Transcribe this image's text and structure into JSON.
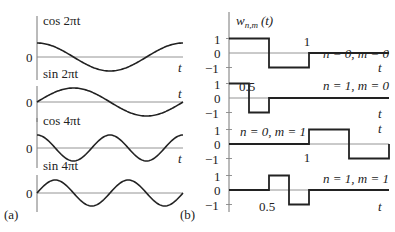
{
  "panel_a": {
    "label": "(a)",
    "zero_label": "0",
    "t_label": "t",
    "plots": [
      {
        "title": "cos 2πt",
        "func": "cos",
        "freq": 1,
        "baseline": 57,
        "amp": 14
      },
      {
        "title": "sin 2πt",
        "func": "sin",
        "freq": 1,
        "baseline": 102,
        "amp": 14
      },
      {
        "title": "cos 4πt",
        "func": "cos",
        "freq": 2,
        "baseline": 148,
        "amp": 13
      },
      {
        "title": "sin 4πt",
        "func": "sin",
        "freq": 2,
        "baseline": 193,
        "amp": 13
      }
    ]
  },
  "panel_b": {
    "label": "(b)",
    "title": "w_{n,m}(t)",
    "title_main": "w",
    "title_sub": "n,m",
    "title_arg": "(t)",
    "t_label": "t",
    "tick_labels": [
      "1",
      "0",
      "−1"
    ],
    "plots": [
      {
        "caption": "n = 0, m = 0",
        "annotation": "1",
        "zero_y": 53,
        "points": [
          [
            0,
            1
          ],
          [
            0.5,
            1
          ],
          [
            0.5,
            -1
          ],
          [
            1,
            -1
          ],
          [
            1,
            0
          ],
          [
            2,
            0
          ]
        ]
      },
      {
        "caption": "n = 1, m = 0",
        "annotation": "0.5",
        "zero_y": 98,
        "points": [
          [
            0,
            1
          ],
          [
            0.25,
            1
          ],
          [
            0.25,
            -1
          ],
          [
            0.5,
            -1
          ],
          [
            0.5,
            0
          ],
          [
            2,
            0
          ]
        ]
      },
      {
        "caption": "n = 0, m = 1",
        "annotation": "1",
        "zero_y": 144,
        "points": [
          [
            0,
            0
          ],
          [
            1,
            0
          ],
          [
            1,
            1
          ],
          [
            1.5,
            1
          ],
          [
            1.5,
            -1
          ],
          [
            2,
            -1
          ],
          [
            2,
            0
          ]
        ]
      },
      {
        "caption": "n = 1, m = 1",
        "annotation": "0.5",
        "zero_y": 190,
        "points": [
          [
            0,
            0
          ],
          [
            0.5,
            0
          ],
          [
            0.5,
            1
          ],
          [
            0.75,
            1
          ],
          [
            0.75,
            -1
          ],
          [
            1,
            -1
          ],
          [
            1,
            0
          ],
          [
            2,
            0
          ]
        ]
      }
    ]
  },
  "chart_data": [
    {
      "type": "line",
      "title": "(a) Sinusoidal basis functions",
      "series": [
        {
          "name": "cos 2πt",
          "x": [
            0,
            0.25,
            0.5,
            0.75,
            1
          ],
          "values": [
            1,
            0,
            -1,
            0,
            1
          ]
        },
        {
          "name": "sin 2πt",
          "x": [
            0,
            0.25,
            0.5,
            0.75,
            1
          ],
          "values": [
            0,
            1,
            0,
            -1,
            0
          ]
        },
        {
          "name": "cos 4πt",
          "x": [
            0,
            0.125,
            0.25,
            0.375,
            0.5,
            0.625,
            0.75,
            0.875,
            1
          ],
          "values": [
            1,
            0,
            -1,
            0,
            1,
            0,
            -1,
            0,
            1
          ]
        },
        {
          "name": "sin 4πt",
          "x": [
            0,
            0.125,
            0.25,
            0.375,
            0.5,
            0.625,
            0.75,
            0.875,
            1
          ],
          "values": [
            0,
            1,
            0,
            -1,
            0,
            1,
            0,
            -1,
            0
          ]
        }
      ],
      "xlabel": "t",
      "ylabel": ""
    },
    {
      "type": "line",
      "title": "(b) Haar wavelets w_{n,m}(t)",
      "series": [
        {
          "name": "n = 0, m = 0",
          "x": [
            0,
            0.5,
            0.5,
            1,
            1,
            2
          ],
          "values": [
            1,
            1,
            -1,
            -1,
            0,
            0
          ]
        },
        {
          "name": "n = 1, m = 0",
          "x": [
            0,
            0.25,
            0.25,
            0.5,
            0.5,
            2
          ],
          "values": [
            1,
            1,
            -1,
            -1,
            0,
            0
          ]
        },
        {
          "name": "n = 0, m = 1",
          "x": [
            0,
            1,
            1,
            1.5,
            1.5,
            2,
            2
          ],
          "values": [
            0,
            0,
            1,
            1,
            -1,
            -1,
            0
          ]
        },
        {
          "name": "n = 1, m = 1",
          "x": [
            0,
            0.5,
            0.5,
            0.75,
            0.75,
            1,
            1,
            2
          ],
          "values": [
            0,
            0,
            1,
            1,
            -1,
            -1,
            0,
            0
          ]
        }
      ],
      "xlabel": "t",
      "ylabel": "w_{n,m}(t)",
      "yticks": [
        -1,
        0,
        1
      ]
    }
  ]
}
